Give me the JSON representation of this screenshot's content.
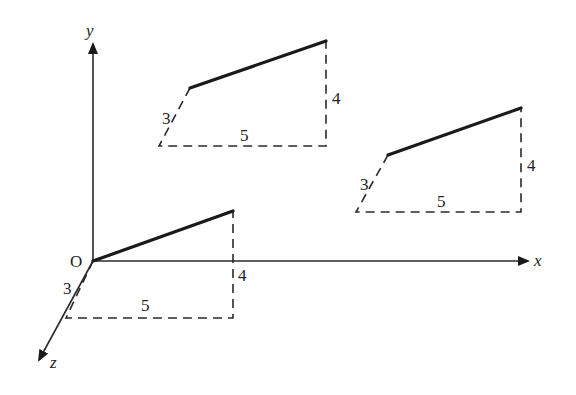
{
  "diagram": {
    "type": "3d-vector-translation",
    "colors": {
      "ink": "#222222",
      "background": "#ffffff"
    },
    "axes": {
      "origin_label": "O",
      "x_label": "x",
      "y_label": "y",
      "z_label": "z"
    },
    "vectors": [
      {
        "id": "at-origin",
        "components": {
          "x": 5,
          "y": 4,
          "z": 3
        },
        "labels": {
          "x": "5",
          "y": "4",
          "z": "3"
        }
      },
      {
        "id": "translated-upper-left",
        "components": {
          "x": 5,
          "y": 4,
          "z": 3
        },
        "labels": {
          "x": "5",
          "y": "4",
          "z": "3"
        }
      },
      {
        "id": "translated-right",
        "components": {
          "x": 5,
          "y": 4,
          "z": 3
        },
        "labels": {
          "x": "5",
          "y": "4",
          "z": "3"
        }
      }
    ]
  }
}
